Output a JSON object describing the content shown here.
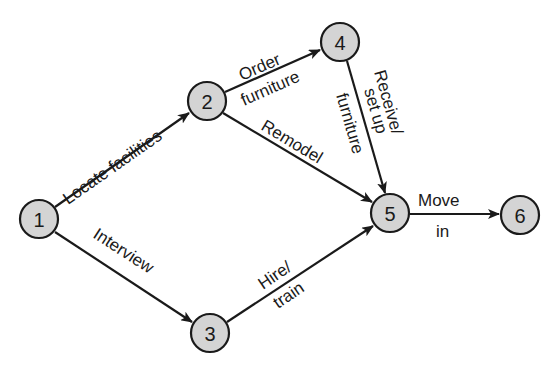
{
  "diagram": {
    "type": "activity-on-arrow network",
    "nodes": [
      {
        "id": "1",
        "label": "1",
        "x": 39,
        "y": 219
      },
      {
        "id": "2",
        "label": "2",
        "x": 207,
        "y": 101
      },
      {
        "id": "3",
        "label": "3",
        "x": 210,
        "y": 333
      },
      {
        "id": "4",
        "label": "4",
        "x": 340,
        "y": 42
      },
      {
        "id": "5",
        "label": "5",
        "x": 390,
        "y": 213
      },
      {
        "id": "6",
        "label": "6",
        "x": 520,
        "y": 215
      }
    ],
    "edges": [
      {
        "from": "1",
        "to": "2",
        "label_lines": [
          "Locate facilities"
        ]
      },
      {
        "from": "1",
        "to": "3",
        "label_lines": [
          "Interview"
        ]
      },
      {
        "from": "2",
        "to": "4",
        "label_lines": [
          "Order",
          "furniture"
        ]
      },
      {
        "from": "2",
        "to": "5",
        "label_lines": [
          "Remodel"
        ]
      },
      {
        "from": "4",
        "to": "5",
        "label_lines": [
          "Receive/",
          "set up",
          "furniture"
        ]
      },
      {
        "from": "3",
        "to": "5",
        "label_lines": [
          "Hire/",
          "train"
        ]
      },
      {
        "from": "5",
        "to": "6",
        "label_lines": [
          "Move",
          "in"
        ]
      }
    ],
    "colors": {
      "node_fill": "#d4d4d4",
      "stroke": "#1a1a1a",
      "background": "#ffffff"
    }
  }
}
